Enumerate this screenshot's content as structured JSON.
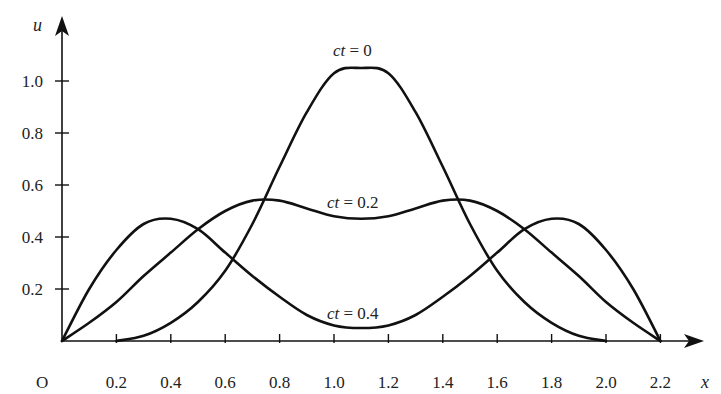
{
  "chart_data": {
    "type": "line",
    "title": "",
    "xlabel": "x",
    "ylabel": "u",
    "origin_label": "O",
    "xlim": [
      0,
      2.3
    ],
    "ylim": [
      0,
      1.15
    ],
    "grid": false,
    "legend": "none (curves labelled inline)",
    "x_ticks": [
      0.2,
      0.4,
      0.6,
      0.8,
      1.0,
      1.2,
      1.4,
      1.6,
      1.8,
      2.0,
      2.2
    ],
    "x_tick_labels": [
      "0.2",
      "0.4",
      "0.6",
      "0.8",
      "1.0",
      "1.2",
      "1.4",
      "1.6",
      "1.8",
      "2.0",
      "2.2"
    ],
    "y_ticks": [
      0.2,
      0.4,
      0.6,
      0.8,
      1.0
    ],
    "y_tick_labels": [
      "0.2",
      "0.4",
      "0.6",
      "0.8",
      "1.0"
    ],
    "series": [
      {
        "name": "ct = 0",
        "label_prefix": "ct",
        "label_value": " = 0",
        "x": [
          0.2,
          0.3,
          0.4,
          0.5,
          0.6,
          0.7,
          0.8,
          0.9,
          1.0,
          1.1,
          1.2,
          1.3,
          1.4,
          1.5,
          1.6,
          1.7,
          1.8,
          1.9,
          2.0
        ],
        "values": [
          0.0,
          0.02,
          0.07,
          0.15,
          0.27,
          0.45,
          0.67,
          0.88,
          1.03,
          1.05,
          1.03,
          0.88,
          0.67,
          0.45,
          0.27,
          0.15,
          0.07,
          0.02,
          0.0
        ]
      },
      {
        "name": "ct = 0.2",
        "label_prefix": "ct",
        "label_value": " = 0.2",
        "x": [
          0.0,
          0.1,
          0.2,
          0.3,
          0.4,
          0.5,
          0.6,
          0.7,
          0.8,
          0.9,
          1.0,
          1.1,
          1.2,
          1.3,
          1.4,
          1.5,
          1.6,
          1.7,
          1.8,
          1.9,
          2.0,
          2.1,
          2.2
        ],
        "values": [
          0.0,
          0.07,
          0.15,
          0.25,
          0.34,
          0.43,
          0.5,
          0.54,
          0.54,
          0.51,
          0.48,
          0.47,
          0.48,
          0.51,
          0.54,
          0.54,
          0.5,
          0.43,
          0.34,
          0.25,
          0.15,
          0.07,
          0.0
        ]
      },
      {
        "name": "ct = 0.4",
        "label_prefix": "ct",
        "label_value": " = 0.4",
        "x": [
          0.0,
          0.1,
          0.2,
          0.3,
          0.4,
          0.5,
          0.6,
          0.7,
          0.8,
          0.9,
          1.0,
          1.1,
          1.2,
          1.3,
          1.4,
          1.5,
          1.6,
          1.7,
          1.8,
          1.9,
          2.0,
          2.1,
          2.2
        ],
        "values": [
          0.0,
          0.2,
          0.35,
          0.45,
          0.47,
          0.43,
          0.34,
          0.25,
          0.17,
          0.1,
          0.06,
          0.05,
          0.06,
          0.1,
          0.17,
          0.25,
          0.34,
          0.43,
          0.47,
          0.45,
          0.35,
          0.2,
          0.0
        ]
      }
    ]
  }
}
